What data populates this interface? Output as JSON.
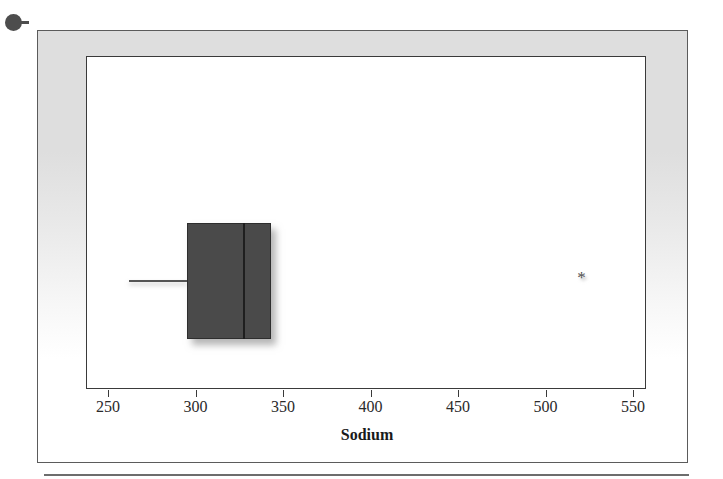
{
  "figure": {
    "bullet_marker": "bullet-marker",
    "frame_label": "figure-frame"
  },
  "chart_data": {
    "type": "boxplot",
    "title": "",
    "subtitle": "",
    "xlabel": "Sodium",
    "ylabel": "",
    "orientation": "horizontal",
    "xlim": [
      238,
      558
    ],
    "xticks": [
      250,
      300,
      350,
      400,
      450,
      500,
      550
    ],
    "xtick_labels": [
      "250",
      "300",
      "350",
      "400",
      "450",
      "500",
      "550"
    ],
    "grid": false,
    "legend": false,
    "series": [
      {
        "name": "Sodium",
        "min_whisker": 262,
        "q1": 295,
        "median": 327,
        "q3": 343,
        "max_whisker": 343,
        "outliers": [
          521
        ],
        "outlier_marker": "asterisk"
      }
    ],
    "colors": {
      "box_fill": "#4a4a4a",
      "box_edge": "#2e2e2e",
      "median_line": "#1f1f1f",
      "whisker": "#555555",
      "outlier": "#4f4f4f",
      "plot_background": "#ffffff",
      "mat_background": "#dedede",
      "axis_line": "#3a3a3a"
    }
  }
}
